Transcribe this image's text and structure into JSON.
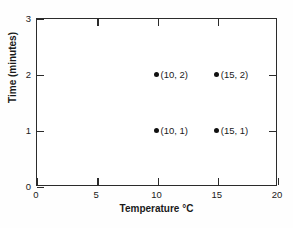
{
  "chart_data": {
    "type": "scatter",
    "title": "",
    "xlabel": "Temperature °C",
    "ylabel": "Time (minutes)",
    "xlim": [
      0,
      20
    ],
    "ylim": [
      0,
      3
    ],
    "xticks": [
      0,
      5,
      10,
      15,
      20
    ],
    "yticks": [
      0,
      1,
      2,
      3
    ],
    "xticklabels": [
      "0",
      "5",
      "10",
      "15",
      "20"
    ],
    "yticklabels": [
      "0",
      "1",
      "2",
      "3"
    ],
    "grid": false,
    "legend": false,
    "marker_color": "#111111",
    "axis_color": "#2b2b2b",
    "background_color": "#ffffff",
    "points": [
      {
        "x": 10,
        "y": 2,
        "label": "(10, 2)"
      },
      {
        "x": 15,
        "y": 2,
        "label": "(15, 2)"
      },
      {
        "x": 10,
        "y": 1,
        "label": "(10, 1)"
      },
      {
        "x": 15,
        "y": 1,
        "label": "(15, 1)"
      }
    ]
  }
}
